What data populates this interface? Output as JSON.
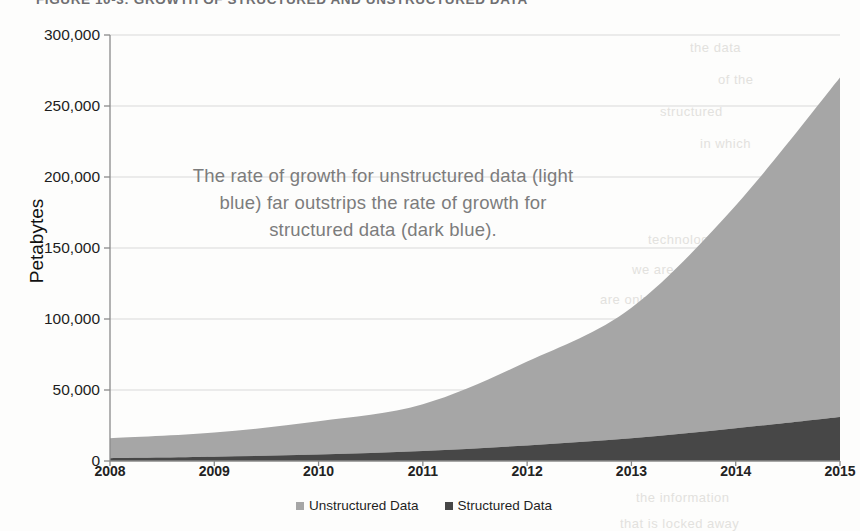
{
  "figure": {
    "title": "FIGURE 10-3: GROWTH OF STRUCTURED AND UNSTRUCTURED DATA"
  },
  "annotation": {
    "text": "The rate of growth for unstructured data (light blue) far outstrips the rate of growth for structured data (dark blue)."
  },
  "colors": {
    "unstructured": "#a6a6a6",
    "structured": "#474747",
    "axis": "#8a8a8a",
    "grid": "#d9d9d9",
    "annotation_text": "#7c7c7c"
  },
  "legend": {
    "items": [
      {
        "label": "Unstructured Data",
        "color": "#a6a6a6",
        "swatch": "square-marker"
      },
      {
        "label": "Structured Data",
        "color": "#474747",
        "swatch": "square-marker"
      }
    ]
  },
  "page_bleed": [
    {
      "text": "the data",
      "x": 690,
      "y": 40
    },
    {
      "text": "of the",
      "x": 718,
      "y": 72
    },
    {
      "text": "structured",
      "x": 660,
      "y": 104
    },
    {
      "text": "in which",
      "x": 700,
      "y": 136
    },
    {
      "text": "technology",
      "x": 648,
      "y": 232
    },
    {
      "text": "we are able to",
      "x": 632,
      "y": 262
    },
    {
      "text": "are only able to handle",
      "x": 600,
      "y": 292
    },
    {
      "text": "unstructured data is",
      "x": 612,
      "y": 322
    },
    {
      "text": "and the value of",
      "x": 640,
      "y": 352
    },
    {
      "text": "the information",
      "x": 636,
      "y": 490
    },
    {
      "text": "that is locked away",
      "x": 620,
      "y": 516
    }
  ],
  "chart_data": {
    "type": "area",
    "stacked": true,
    "title": "GROWTH OF STRUCTURED AND UNSTRUCTURED DATA",
    "xlabel": "",
    "ylabel": "Petabytes",
    "x": [
      2008,
      2009,
      2010,
      2011,
      2012,
      2013,
      2014,
      2015
    ],
    "categories": [
      "2008",
      "2009",
      "2010",
      "2011",
      "2012",
      "2013",
      "2014",
      "2015"
    ],
    "xtick_labels": [
      "2008",
      "2009",
      "2010",
      "2011",
      "2012",
      "2013",
      "2014",
      "2015"
    ],
    "ytick_labels": [
      "0",
      "50,000",
      "100,000",
      "150,000",
      "200,000",
      "250,000",
      "300,000"
    ],
    "ytick_values": [
      0,
      50000,
      100000,
      150000,
      200000,
      250000,
      300000
    ],
    "ylim": [
      0,
      300000
    ],
    "xlim": [
      2008,
      2015
    ],
    "grid": true,
    "legend_position": "bottom",
    "series": [
      {
        "name": "Structured Data",
        "color": "#474747",
        "values": [
          2000,
          3000,
          4500,
          7000,
          11000,
          16000,
          23000,
          31000
        ]
      },
      {
        "name": "Unstructured Data",
        "color": "#a6a6a6",
        "values": [
          14000,
          17000,
          23500,
          33000,
          59000,
          92000,
          157000,
          239000
        ]
      }
    ],
    "totals": [
      16000,
      20000,
      28000,
      40000,
      70000,
      108000,
      180000,
      270000
    ]
  }
}
